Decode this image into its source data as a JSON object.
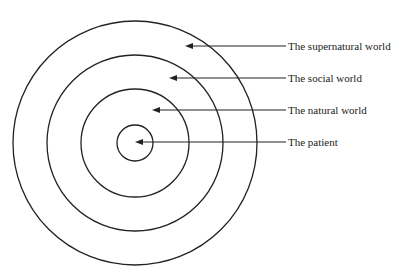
{
  "diagram": {
    "type": "concentric-circles",
    "center": {
      "x": 135,
      "y": 143
    },
    "stroke_color": "#222222",
    "rings": [
      {
        "name": "supernatural",
        "radius": 122
      },
      {
        "name": "social",
        "radius": 88
      },
      {
        "name": "natural",
        "radius": 54
      },
      {
        "name": "patient",
        "radius": 18
      }
    ],
    "labels": [
      {
        "text": "The supernatural world",
        "y": 46,
        "arrow_tip_x": 185
      },
      {
        "text": "The social world",
        "y": 78,
        "arrow_tip_x": 169
      },
      {
        "text": "The natural world",
        "y": 110,
        "arrow_tip_x": 152
      },
      {
        "text": "The patient",
        "y": 142,
        "arrow_tip_x": 135
      }
    ]
  }
}
